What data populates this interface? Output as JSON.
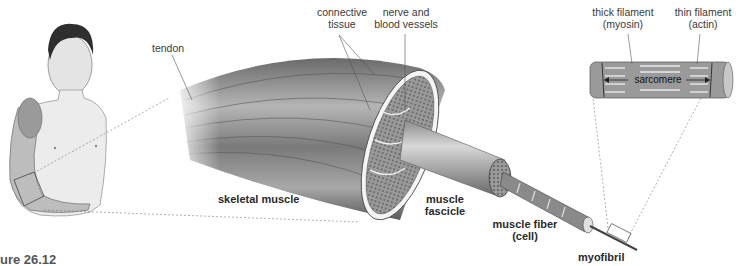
{
  "figure": {
    "caption": "gure 26.12",
    "colors": {
      "background": "#ffffff",
      "muscle_dark": "#555555",
      "muscle_light": "#c8c8c8",
      "skin": "#e8e8e8",
      "label_text": "#3a3a3a"
    }
  },
  "labels": {
    "tendon": "tendon",
    "connective_tissue": [
      "connective",
      "tissue"
    ],
    "nerve_blood_vessels": [
      "nerve and",
      "blood vessels"
    ],
    "skeletal_muscle": "skeletal muscle",
    "muscle_fascicle": [
      "muscle",
      "fascicle"
    ],
    "muscle_fiber": [
      "muscle fiber",
      "(cell)"
    ],
    "myofibril": "myofibril",
    "thick_filament": [
      "thick filament",
      "(myosin)"
    ],
    "thin_filament": [
      "thin filament",
      "(actin)"
    ],
    "sarcomere": "sarcomere"
  }
}
